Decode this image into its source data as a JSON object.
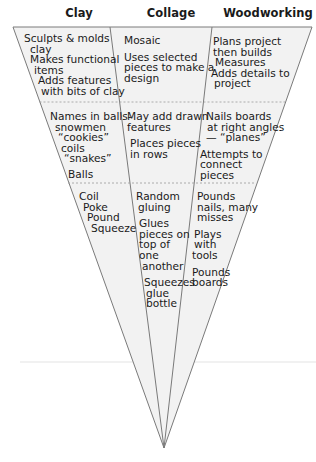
{
  "title": "",
  "columns": [
    {
      "header": "Clay"
    },
    {
      "header": "Collage"
    },
    {
      "header": "Woodworking"
    }
  ],
  "levels": [
    {
      "name": "top",
      "clay": [
        {
          "text": "Sculpts & molds"
        },
        {
          "text": "clay"
        },
        {
          "text": "Makes functional"
        },
        {
          "text": "items"
        },
        {
          "text": "Adds features"
        },
        {
          "text": "with bits of clay"
        }
      ],
      "collage": [
        {
          "text": "Mosaic"
        },
        {
          "text": "Uses selected"
        },
        {
          "text": "pieces to make a"
        },
        {
          "text": "design"
        }
      ],
      "woodworking": [
        {
          "text": "Plans project"
        },
        {
          "text": "then builds"
        },
        {
          "text": "Measures"
        },
        {
          "text": "Adds details to"
        },
        {
          "text": "project"
        }
      ]
    },
    {
      "name": "middle",
      "clay": [
        {
          "text": "Names in balls-"
        },
        {
          "text": "snowmen"
        },
        {
          "text": "“cookies”"
        },
        {
          "text": "coils"
        },
        {
          "text": "“snakes”"
        },
        {
          "text": "Balls"
        }
      ],
      "collage": [
        {
          "text": "May add drawn"
        },
        {
          "text": "features"
        },
        {
          "text": "Places pieces"
        },
        {
          "text": "in rows"
        }
      ],
      "woodworking": [
        {
          "text": "Nails boards"
        },
        {
          "text": "at right angles"
        },
        {
          "text": "— “planes”"
        },
        {
          "text": "Attempts to"
        },
        {
          "text": "connect"
        },
        {
          "text": "pieces"
        }
      ]
    },
    {
      "name": "bottom",
      "clay": [
        {
          "text": "Coil"
        },
        {
          "text": "Poke"
        },
        {
          "text": "Pound"
        },
        {
          "text": "Squeeze"
        }
      ],
      "collage": [
        {
          "text": "Random"
        },
        {
          "text": "gluing"
        },
        {
          "text": "Glues"
        },
        {
          "text": "pieces on"
        },
        {
          "text": "top of"
        },
        {
          "text": "one"
        },
        {
          "text": "another"
        },
        {
          "text": "Squeezes"
        },
        {
          "text": "glue"
        },
        {
          "text": "bottle"
        }
      ],
      "woodworking": [
        {
          "text": "Pounds"
        },
        {
          "text": "nails, many"
        },
        {
          "text": "misses"
        },
        {
          "text": "Plays"
        },
        {
          "text": "with"
        },
        {
          "text": "tools"
        },
        {
          "text": "Pounds"
        },
        {
          "text": "boards"
        }
      ]
    }
  ],
  "colors": {
    "fill": "#f2f2f2",
    "outline": "#7a7a7a",
    "dash": "#9a9a9a",
    "faint_rule": "#ececec",
    "text": "#1a1a1a"
  }
}
